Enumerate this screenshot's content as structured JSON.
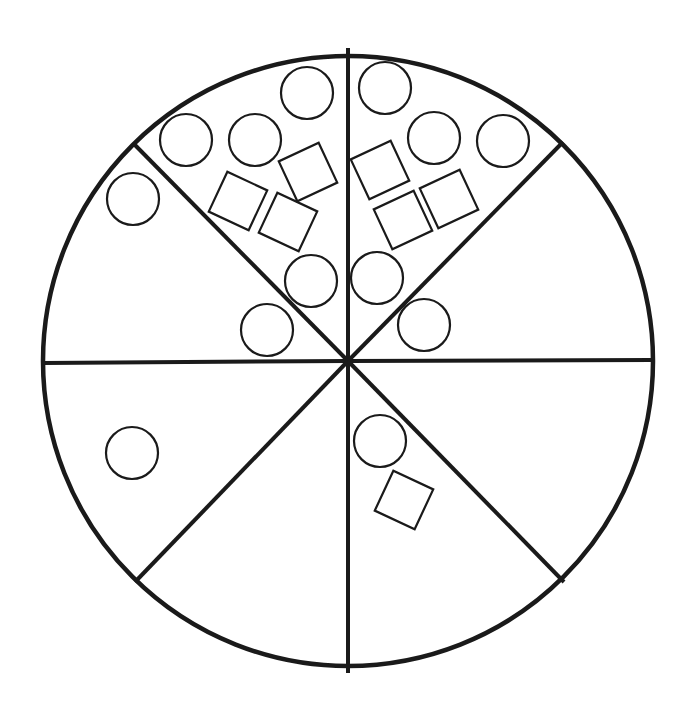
{
  "diagram": {
    "colors": {
      "stroke": "#1a1a1a",
      "background": "#ffffff"
    },
    "sectors": [
      {
        "id": "top-right-upper",
        "circles": 5,
        "squares": 3
      },
      {
        "id": "right-upper",
        "circles": 0,
        "squares": 0
      },
      {
        "id": "right-lower",
        "circles": 0,
        "squares": 0
      },
      {
        "id": "bottom-right",
        "circles": 1,
        "squares": 1
      },
      {
        "id": "bottom-left",
        "circles": 0,
        "squares": 0
      },
      {
        "id": "left-lower",
        "circles": 1,
        "squares": 0
      },
      {
        "id": "left-upper",
        "circles": 1,
        "squares": 0
      },
      {
        "id": "top-left-upper",
        "circles": 5,
        "squares": 3
      }
    ]
  }
}
